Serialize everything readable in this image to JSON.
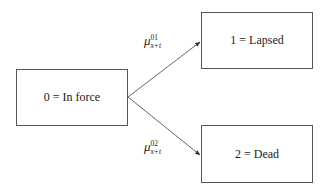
{
  "diagram": {
    "type": "multiple-state model",
    "states": [
      {
        "id": 0,
        "label": "0 = In force"
      },
      {
        "id": 1,
        "label": "1 = Lapsed"
      },
      {
        "id": 2,
        "label": "2 = Dead"
      }
    ],
    "transitions": [
      {
        "from": 0,
        "to": 1,
        "symbol": "μ",
        "superscript": "01",
        "subscript": "x+t"
      },
      {
        "from": 0,
        "to": 2,
        "symbol": "μ",
        "superscript": "02",
        "subscript": "x+t"
      }
    ],
    "colors": {
      "stroke": "#555555",
      "text": "#222222",
      "background": "#ffffff"
    }
  }
}
